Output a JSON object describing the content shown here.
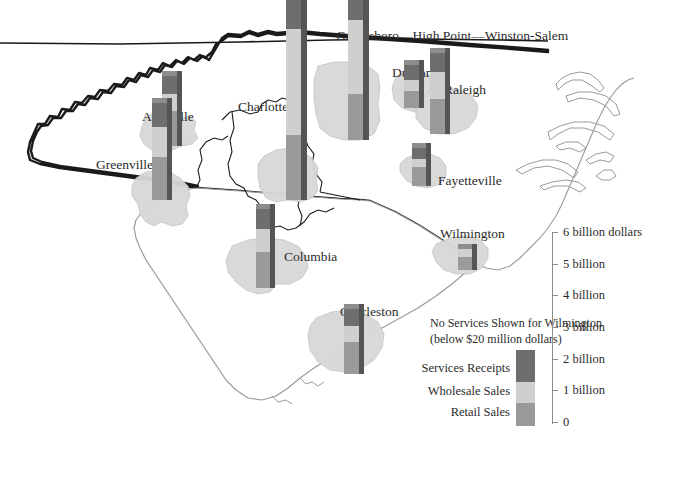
{
  "figure": {
    "type": "thematic-map",
    "region": "North Carolina and South Carolina",
    "units": "billions of dollars"
  },
  "corridor": {
    "label": "Greensboro—High Point—Winston-Salem"
  },
  "cities": [
    {
      "name": "Asheville",
      "label": "Asheville",
      "retail": 1.1,
      "wholesale": 0.55,
      "services": 0.55
    },
    {
      "name": "Greenville",
      "label": "Greenville",
      "retail": 1.35,
      "wholesale": 0.95,
      "services": 0.75
    },
    {
      "name": "Charlotte",
      "label": "Charlotte",
      "retail": 2.05,
      "wholesale": 3.35,
      "services": 0.95
    },
    {
      "name": "Greensboro",
      "label": "",
      "retail": 1.45,
      "wholesale": 2.35,
      "services": 0.75
    },
    {
      "name": "Durham",
      "label": "Durham",
      "retail": 0.55,
      "wholesale": 0.35,
      "services": 0.45
    },
    {
      "name": "Raleigh",
      "label": "Raleigh",
      "retail": 1.1,
      "wholesale": 0.85,
      "services": 0.6
    },
    {
      "name": "Fayetteville",
      "label": "Fayetteville",
      "retail": 0.6,
      "wholesale": 0.25,
      "services": 0.35
    },
    {
      "name": "Columbia",
      "label": "Columbia",
      "retail": 1.15,
      "wholesale": 0.7,
      "services": 0.65
    },
    {
      "name": "Charleston",
      "label": "Charleston",
      "retail": 1.0,
      "wholesale": 0.5,
      "services": 0.55
    },
    {
      "name": "Wilmington",
      "label": "Wilmington",
      "retail": 0.4,
      "wholesale": 0.25,
      "services": 0.0
    }
  ],
  "note": {
    "line1": "No Services Shown for Wilmington",
    "line2": "(below $20 million dollars)"
  },
  "legend": {
    "items": [
      {
        "key": "services",
        "label": "Services Receipts",
        "color": "#6e6e6e"
      },
      {
        "key": "wholesale",
        "label": "Wholesale Sales",
        "color": "#cfcfcf"
      },
      {
        "key": "retail",
        "label": "Retail Sales",
        "color": "#9a9a9a"
      }
    ]
  },
  "scale": {
    "ticks": [
      {
        "value": 6,
        "label": "6 billion dollars"
      },
      {
        "value": 5,
        "label": "5 billion"
      },
      {
        "value": 4,
        "label": "4 billion"
      },
      {
        "value": 3,
        "label": "3 billion"
      },
      {
        "value": 2,
        "label": "2 billion"
      },
      {
        "value": 1,
        "label": "1 billion"
      },
      {
        "value": 0,
        "label": "0"
      }
    ],
    "min": 0,
    "max": 6
  },
  "chart_data": {
    "type": "bar",
    "title": "",
    "xlabel": "",
    "ylabel": "billions of dollars",
    "ylim": [
      0,
      6
    ],
    "categories": [
      "Asheville",
      "Greenville",
      "Charlotte",
      "Greensboro—High Point—Winston-Salem",
      "Durham",
      "Raleigh",
      "Fayetteville",
      "Columbia",
      "Charleston",
      "Wilmington"
    ],
    "series": [
      {
        "name": "Retail Sales",
        "values": [
          1.1,
          1.35,
          2.05,
          1.45,
          0.55,
          1.1,
          0.6,
          1.15,
          1.0,
          0.4
        ]
      },
      {
        "name": "Wholesale Sales",
        "values": [
          0.55,
          0.95,
          3.35,
          2.35,
          0.35,
          0.85,
          0.25,
          0.7,
          0.5,
          0.25
        ]
      },
      {
        "name": "Services Receipts",
        "values": [
          0.55,
          0.75,
          0.95,
          0.75,
          0.45,
          0.6,
          0.35,
          0.65,
          0.55,
          0.0
        ]
      }
    ],
    "stacked": true,
    "legend_position": "bottom-right",
    "grid": false
  }
}
